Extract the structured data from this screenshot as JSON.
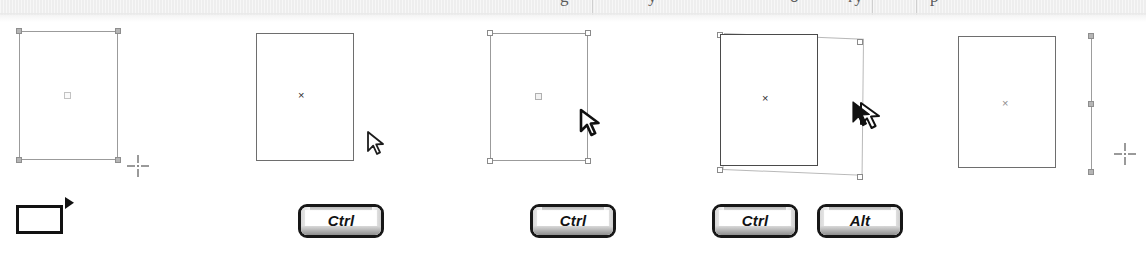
{
  "figure": {
    "title_bleed": "g   y        o   r y     p",
    "background_color": "#ffffff",
    "strip_color": "#eeeeee",
    "outline_color": "#6e6e6e",
    "handle_color": "#b5b5b5",
    "ink_color": "#171717",
    "bleed_fragments": [
      {
        "text": "g",
        "left": 560
      },
      {
        "text": "y",
        "left": 648
      },
      {
        "text": "o",
        "left": 790
      },
      {
        "text": "ry",
        "left": 848
      },
      {
        "text": "p",
        "left": 930
      }
    ],
    "strip_rules": [
      592,
      872,
      916,
      1238
    ]
  },
  "panels": [
    {
      "id": "panel-1",
      "name": "draw-rectangle-step",
      "shape": "rectangle",
      "handles": "filled-corner-handles",
      "center_marker": "small-square",
      "cursor": "crosshair",
      "keys": [],
      "tool_icon": "rectangle-tool-icon"
    },
    {
      "id": "panel-2",
      "name": "move-rectangle-step",
      "shape": "rectangle",
      "handles": "none",
      "center_marker": "x-mark",
      "cursor": "arrow-pointer",
      "keys": [
        "Ctrl"
      ]
    },
    {
      "id": "panel-3",
      "name": "select-edge-step",
      "shape": "rectangle",
      "handles": "hollow-corner-handles",
      "center_marker": "small-square",
      "cursor": "arrow-pointer-bold",
      "keys": [
        "Ctrl"
      ]
    },
    {
      "id": "panel-4",
      "name": "skew-duplicate-step",
      "shape": "rectangle-with-skew-preview",
      "handles": "hollow-corner-handles",
      "center_marker": "x-mark",
      "cursor": "duplicate-arrow",
      "keys": [
        "Ctrl",
        "Alt"
      ]
    },
    {
      "id": "panel-5",
      "name": "draw-line-step",
      "shape": "rectangle-and-vertical-line",
      "handles": "filled-line-handles",
      "center_marker": "x-mark",
      "cursor": "crosshair",
      "keys": []
    }
  ],
  "icons": {
    "rectangle_tool": "rectangle-tool-icon",
    "crosshair": "crosshair-cursor-icon",
    "pointer": "arrow-pointer-icon",
    "duplicate_pointer": "duplicate-arrow-cursor-icon"
  },
  "center_marks": {
    "x": "×"
  },
  "keys": {
    "ctrl": "Ctrl",
    "alt": "Alt"
  }
}
